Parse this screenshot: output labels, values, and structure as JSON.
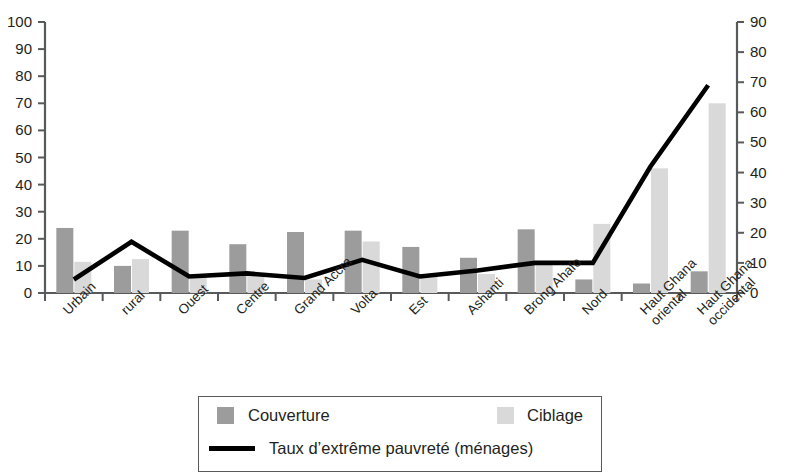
{
  "chart_data": {
    "type": "bar",
    "title": "",
    "subtitle": "",
    "xlabel": "",
    "ylabel": "",
    "grid": false,
    "legend_position": "bottom",
    "categories": [
      "Urbain",
      "rural",
      "Ouest",
      "Centre",
      "Grand Accra",
      "Volta",
      "Est",
      "Ashanti",
      "Brong Ahafo",
      "Nord",
      "Haut Ghana\noriental",
      "Haut Ghana\noccidental"
    ],
    "left_axis": {
      "ticks": [
        0,
        10,
        20,
        30,
        40,
        50,
        60,
        70,
        80,
        90,
        100
      ],
      "min": 0,
      "max": 100
    },
    "right_axis": {
      "ticks": [
        0,
        10,
        20,
        30,
        40,
        50,
        60,
        70,
        80,
        90
      ],
      "min": 0,
      "max": 90
    },
    "series": [
      {
        "name": "Couverture",
        "type": "bar",
        "axis": "left",
        "color": "#9c9c9c",
        "values": [
          24,
          10,
          23,
          18,
          22.5,
          23,
          17,
          13,
          23.5,
          5,
          3.5,
          8
        ]
      },
      {
        "name": "Ciblage",
        "type": "bar",
        "axis": "left",
        "color": "#d9d9d9",
        "values": [
          11.5,
          12.5,
          6,
          7,
          5,
          19,
          6,
          7,
          10.5,
          25.5,
          46,
          70
        ]
      },
      {
        "name": "Taux d’extrême pauvreté (ménages)",
        "type": "line",
        "axis": "right",
        "color": "#000000",
        "values": [
          4.5,
          17,
          5.5,
          6.5,
          5,
          11,
          5.5,
          7.5,
          10,
          10,
          42,
          69
        ]
      }
    ]
  },
  "legend": {
    "couverture_label": "Couverture",
    "ciblage_label": "Ciblage",
    "line_label": "Taux d’extrême pauvreté (ménages)"
  }
}
